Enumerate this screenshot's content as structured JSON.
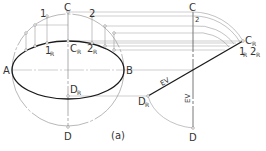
{
  "figure": {
    "caption": "(a)",
    "colors": {
      "background": "#ffffff",
      "thin_line": "#9a9a9a",
      "thick_line": "#1a1a1a",
      "text": "#333333"
    }
  },
  "front_view": {
    "points": {
      "A": "A",
      "B": "B",
      "C": "C",
      "D": "D",
      "p1": "1",
      "p2": "2",
      "CR": {
        "main": "C",
        "sub": "R"
      },
      "DR": {
        "main": "D",
        "sub": "R"
      },
      "p1R": {
        "main": "1",
        "sub": "R"
      },
      "p2R": {
        "main": "2",
        "sub": "R"
      }
    }
  },
  "edge_view": {
    "points": {
      "C": "C",
      "D": "D",
      "p2": "2",
      "CR": {
        "main": "C",
        "sub": "R"
      },
      "DR": {
        "main": "D",
        "sub": "R"
      },
      "p1R": {
        "main": "1",
        "sub": "R"
      },
      "p2R": {
        "main": "2",
        "sub": "R"
      }
    },
    "labels": {
      "ev_inclined": "EV",
      "ev_vertical": "EV"
    }
  }
}
